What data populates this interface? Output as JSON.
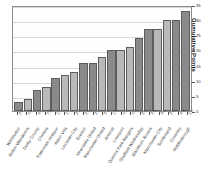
{
  "chart_data": {
    "type": "bar",
    "title": "",
    "subtitle": "",
    "xlabel": "",
    "ylabel": "Cumulative Points",
    "ylim": [
      0,
      35
    ],
    "yticks": [
      0,
      5,
      10,
      15,
      20,
      25,
      30,
      35
    ],
    "grid": true,
    "legend": "none",
    "categories": [
      "Wimbledon",
      "Bolton Wanderers",
      "Derby County",
      "Chelsea",
      "Tottenham Hotspur",
      "Aston Villa",
      "Leicester City",
      "Everton",
      "Newcastle United",
      "Manchester United",
      "Arsenal",
      "Liverpool",
      "Queens Park Rangers",
      "Sheffield Wednesday",
      "Blackburn Rovers",
      "Manchester City",
      "Sunderland",
      "Coventry",
      "Middlesbrough"
    ],
    "value_labels": [
      "2.0",
      "0.6",
      "4.2",
      "0.6",
      "1.1",
      "1.7",
      "2.2",
      "2.4",
      "2.4",
      "3.0",
      "1.7",
      "0.4",
      "0.8",
      "2.0",
      "3.1",
      "3.4",
      "2.0",
      "4.1",
      "1.0"
    ],
    "values": [
      3,
      4,
      7,
      8,
      11,
      12,
      13,
      16,
      16,
      18,
      20,
      20,
      21,
      24,
      27,
      27,
      30,
      30,
      33
    ],
    "bar_shades": [
      "dark",
      "light",
      "dark",
      "light",
      "dark",
      "light",
      "light",
      "dark",
      "dark",
      "light",
      "dark",
      "light",
      "light",
      "dark",
      "dark",
      "light",
      "light",
      "dark",
      "dark"
    ],
    "colors": {
      "bar_light": "#b9b9b9",
      "bar_dark": "#8a8a8a",
      "bar_edge": "#5d5d5d",
      "grid": "#d8d8d8",
      "frame": "#8d8d8d",
      "plot_background": "#fefefe",
      "page_background": "#ffffff",
      "text": "#3a3a3a"
    }
  }
}
